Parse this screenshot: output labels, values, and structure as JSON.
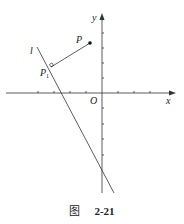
{
  "figure": {
    "axes": {
      "x_label": "x",
      "y_label": "y",
      "origin_label": "O"
    },
    "points": {
      "P": "P",
      "P1_main": "P",
      "P1_sub": "1"
    },
    "line_label": "l",
    "caption": {
      "word": "图",
      "number": "2-21"
    },
    "colors": {
      "stroke": "#333333",
      "background": "#ffffff"
    }
  }
}
